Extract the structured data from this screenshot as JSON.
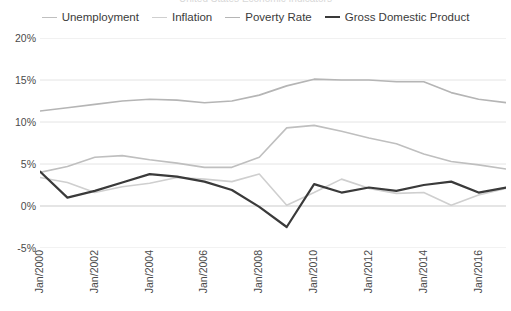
{
  "chart_title": "United States Economic Indicators",
  "legend": {
    "position": "top-center",
    "items": [
      {
        "label": "Unemployment",
        "color": "#bfbfbf",
        "width": 1.6
      },
      {
        "label": "Inflation",
        "color": "#cfcfcf",
        "width": 1.6
      },
      {
        "label": "Poverty Rate",
        "color": "#b5b5b5",
        "width": 1.6
      },
      {
        "label": "Gross Domestic Product",
        "color": "#3a3a3a",
        "width": 2.2
      }
    ]
  },
  "axes": {
    "y_ticks": [
      "20%",
      "15%",
      "10%",
      "5%",
      "0%",
      "-5%"
    ],
    "y_values": [
      20,
      15,
      10,
      5,
      0,
      -5
    ],
    "x_ticks": [
      "Jan/2000",
      "Jan/2002",
      "Jan/2004",
      "Jan/2006",
      "Jan/2008",
      "Jan/2010",
      "Jan/2012",
      "Jan/2014",
      "Jan/2016"
    ],
    "grid_color": "#e4e4e4",
    "zero_line_color": "#dcdcdc"
  },
  "chart_data": {
    "type": "line",
    "title": "United States Economic Indicators",
    "xlabel": "",
    "ylabel": "",
    "ylim": [
      -5,
      20
    ],
    "ytick_step": 5,
    "grid": true,
    "grid_axis": "y",
    "legend_position": "top-center",
    "x": [
      "Jan/2000",
      "Jan/2001",
      "Jan/2002",
      "Jan/2003",
      "Jan/2004",
      "Jan/2005",
      "Jan/2006",
      "Jan/2007",
      "Jan/2008",
      "Jan/2009",
      "Jan/2010",
      "Jan/2011",
      "Jan/2012",
      "Jan/2013",
      "Jan/2014",
      "Jan/2015",
      "Jan/2016",
      "Jan/2017"
    ],
    "x_tick_labels": [
      "Jan/2000",
      "Jan/2002",
      "Jan/2004",
      "Jan/2006",
      "Jan/2008",
      "Jan/2010",
      "Jan/2012",
      "Jan/2014",
      "Jan/2016"
    ],
    "series": [
      {
        "name": "Poverty Rate",
        "color": "#b5b5b5",
        "width": 1.6,
        "values": [
          11.3,
          11.7,
          12.1,
          12.5,
          12.7,
          12.6,
          12.3,
          12.5,
          13.2,
          14.3,
          15.1,
          15.0,
          15.0,
          14.8,
          14.8,
          13.5,
          12.7,
          12.3
        ]
      },
      {
        "name": "Unemployment",
        "color": "#bfbfbf",
        "width": 1.6,
        "values": [
          4.0,
          4.7,
          5.8,
          6.0,
          5.5,
          5.1,
          4.6,
          4.6,
          5.8,
          9.3,
          9.6,
          8.9,
          8.1,
          7.4,
          6.2,
          5.3,
          4.9,
          4.4
        ]
      },
      {
        "name": "Inflation",
        "color": "#cfcfcf",
        "width": 1.6,
        "values": [
          3.4,
          2.8,
          1.6,
          2.3,
          2.7,
          3.4,
          3.2,
          2.9,
          3.8,
          0.1,
          1.6,
          3.2,
          2.1,
          1.5,
          1.6,
          0.1,
          1.3,
          2.1
        ]
      },
      {
        "name": "Gross Domestic Product",
        "color": "#3a3a3a",
        "width": 2.2,
        "values": [
          4.1,
          1.0,
          1.8,
          2.8,
          3.8,
          3.5,
          2.9,
          1.9,
          -0.1,
          -2.5,
          2.6,
          1.6,
          2.2,
          1.8,
          2.5,
          2.9,
          1.6,
          2.2
        ]
      }
    ],
    "annotations": [
      {
        "text": "GDP trough during 2009 recession",
        "series": "Gross Domestic Product",
        "x": "Jan/2009",
        "y": -2.5
      },
      {
        "text": "Unemployment peak",
        "series": "Unemployment",
        "x": "Jan/2010",
        "y": 9.6
      }
    ]
  }
}
